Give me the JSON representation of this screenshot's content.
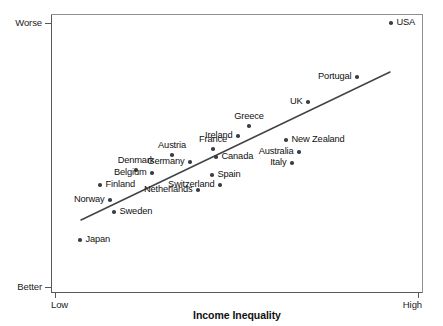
{
  "chart_data": {
    "type": "scatter",
    "title": "",
    "xlabel": "Income Inequality",
    "ylabel": "Index of Health and Social Problems",
    "x_tick_labels": [
      "Low",
      "High"
    ],
    "y_tick_labels": [
      "Worse",
      "Better"
    ],
    "y_tick_order": [
      "Worse (top)",
      "Better (bottom)"
    ],
    "grid": false,
    "legend": "none",
    "axis_ranges": {
      "x": [
        "Low",
        "High"
      ],
      "y": [
        "Better",
        "Worse"
      ]
    },
    "trend_line": {
      "present": true,
      "description": "positive linear fit",
      "x_start_px": 81,
      "y_start_px": 220,
      "x_end_px": 390,
      "y_end_px": 72
    },
    "points": [
      {
        "name": "USA",
        "px": 391,
        "py": 23,
        "label_pos": "right"
      },
      {
        "name": "Portugal",
        "px": 357,
        "py": 77,
        "label_pos": "left"
      },
      {
        "name": "UK",
        "px": 308,
        "py": 102,
        "label_pos": "left"
      },
      {
        "name": "Greece",
        "px": 249,
        "py": 126,
        "label_pos": "above"
      },
      {
        "name": "Ireland",
        "px": 238,
        "py": 136,
        "label_pos": "left"
      },
      {
        "name": "New Zealand",
        "px": 286,
        "py": 140,
        "label_pos": "right"
      },
      {
        "name": "France",
        "px": 213,
        "py": 149,
        "label_pos": "above"
      },
      {
        "name": "Australia",
        "px": 299,
        "py": 152,
        "label_pos": "left"
      },
      {
        "name": "Austria",
        "px": 172,
        "py": 155,
        "label_pos": "above"
      },
      {
        "name": "Canada",
        "px": 216,
        "py": 157,
        "label_pos": "right"
      },
      {
        "name": "Germany",
        "px": 190,
        "py": 162,
        "label_pos": "left"
      },
      {
        "name": "Italy",
        "px": 292,
        "py": 163,
        "label_pos": "left"
      },
      {
        "name": "Denmark",
        "px": 136,
        "py": 170,
        "label_pos": "above"
      },
      {
        "name": "Belgium",
        "px": 152,
        "py": 173,
        "label_pos": "left"
      },
      {
        "name": "Spain",
        "px": 212,
        "py": 175,
        "label_pos": "right"
      },
      {
        "name": "Switzerland",
        "px": 220,
        "py": 185,
        "label_pos": "left"
      },
      {
        "name": "Finland",
        "px": 100,
        "py": 185,
        "label_pos": "right"
      },
      {
        "name": "Netherlands",
        "px": 198,
        "py": 190,
        "label_pos": "left"
      },
      {
        "name": "Norway",
        "px": 110,
        "py": 200,
        "label_pos": "left"
      },
      {
        "name": "Sweden",
        "px": 114,
        "py": 212,
        "label_pos": "right"
      },
      {
        "name": "Japan",
        "px": 80,
        "py": 240,
        "label_pos": "right"
      }
    ],
    "tick_positions": {
      "y": [
        {
          "label": "Worse",
          "py": 23
        },
        {
          "label": "Better",
          "py": 287
        }
      ],
      "x": [
        {
          "label": "Low",
          "px": 55
        },
        {
          "label": "High",
          "px": 418
        }
      ]
    }
  },
  "colors": {
    "point": "#3a3f44",
    "axis": "#555a5e",
    "trend_line": "#3f4448",
    "text": "#111111",
    "background": "#ffffff"
  }
}
